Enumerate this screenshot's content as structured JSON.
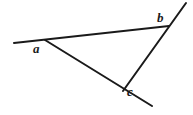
{
  "figure": {
    "width": 193,
    "height": 115,
    "background_color": "#ffffff",
    "stroke_color": "#1a1a1a",
    "stroke_width": 2
  },
  "labels": {
    "a": "a",
    "b": "b",
    "c": "c"
  },
  "chart_data": {
    "type": "diagram",
    "vertices": [
      {
        "name": "a",
        "x": 45,
        "y": 40,
        "label": "a",
        "label_x": 33,
        "label_y": 42
      },
      {
        "name": "b",
        "x": 169,
        "y": 26,
        "label": "b",
        "label_x": 157,
        "label_y": 11
      },
      {
        "name": "c",
        "x": 123,
        "y": 91,
        "label": "c",
        "label_x": 127,
        "label_y": 85
      }
    ],
    "segments": [
      {
        "name": "ray-through-a-and-b",
        "from": [
          14,
          43
        ],
        "to": [
          169,
          26
        ]
      },
      {
        "name": "ray-through-b-and-c",
        "from": [
          186,
          3
        ],
        "to": [
          123,
          91
        ]
      },
      {
        "name": "ray-through-a-and-c",
        "from": [
          45,
          40
        ],
        "to": [
          152,
          106
        ]
      }
    ],
    "xlim": [
      0,
      193
    ],
    "ylim": [
      0,
      115
    ],
    "grid": false,
    "legend": "none"
  }
}
